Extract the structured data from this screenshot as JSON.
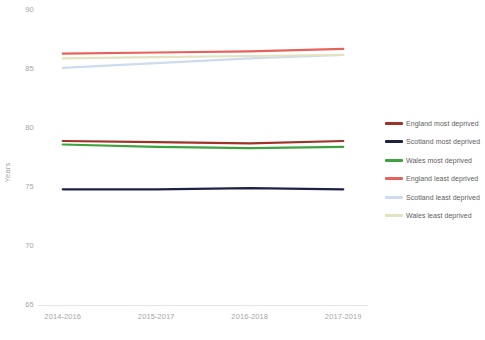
{
  "chart_data": {
    "type": "line",
    "title": "",
    "subtitle": "",
    "xlabel": "",
    "ylabel": "Years",
    "categories": [
      "2014-2016",
      "2015-2017",
      "2016-2018",
      "2017-2019"
    ],
    "ylim": [
      65,
      90
    ],
    "y_ticks": [
      90,
      85,
      80,
      75,
      70,
      65
    ],
    "grid": false,
    "legend_position": "right",
    "series": [
      {
        "name": "England most deprived",
        "color": "#9e3326",
        "values": [
          78.9,
          78.8,
          78.7,
          78.9
        ]
      },
      {
        "name": "Scotland most deprived",
        "color": "#1f2145",
        "values": [
          74.8,
          74.8,
          74.9,
          74.8
        ]
      },
      {
        "name": "Wales most deprived",
        "color": "#3ea33e",
        "values": [
          78.6,
          78.4,
          78.3,
          78.4
        ]
      },
      {
        "name": "England least deprived",
        "color": "#e8625c",
        "values": [
          86.3,
          86.4,
          86.5,
          86.7
        ]
      },
      {
        "name": "Scotland least deprived",
        "color": "#ccdcee",
        "values": [
          85.1,
          85.5,
          85.9,
          86.2
        ]
      },
      {
        "name": "Wales least deprived",
        "color": "#e3e3c0",
        "values": [
          85.9,
          86.0,
          86.1,
          86.2
        ]
      }
    ]
  },
  "axis": {
    "y_title": "Years",
    "y_tick_labels": [
      "90",
      "85",
      "80",
      "75",
      "70",
      "65"
    ],
    "x_tick_labels": [
      "2014-2016",
      "2015-2017",
      "2016-2018",
      "2017-2019"
    ]
  },
  "legend": {
    "items": [
      {
        "label": "England most deprived",
        "color": "#9e3326"
      },
      {
        "label": "Scotland most deprived",
        "color": "#1f2145"
      },
      {
        "label": "Wales most deprived",
        "color": "#3ea33e"
      },
      {
        "label": "England least deprived",
        "color": "#e8625c"
      },
      {
        "label": "Scotland least deprived",
        "color": "#ccdcee"
      },
      {
        "label": "Wales least deprived",
        "color": "#e3e3c0"
      }
    ]
  },
  "colors": {
    "axis_text": "#a6a6a6",
    "legend_text": "#5e5e5e",
    "axis_line": "#e6e6e6",
    "background": "#ffffff"
  }
}
